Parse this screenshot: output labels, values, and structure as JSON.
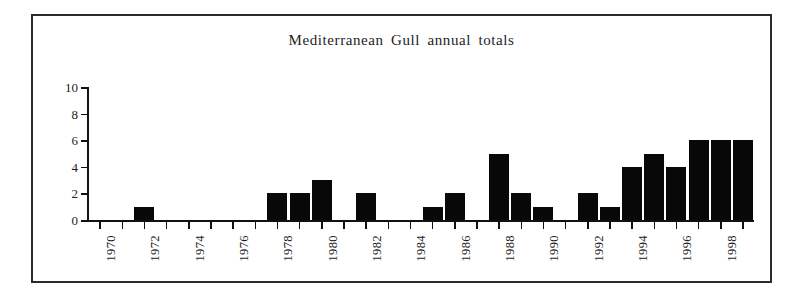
{
  "figure": {
    "title": "Mediterranean Gull annual totals",
    "frame_color": "#2b2b2b",
    "background": "#ffffff",
    "bar_color": "#080808"
  },
  "chart_data": {
    "type": "bar",
    "title": "Mediterranean Gull annual totals",
    "xlabel": "",
    "ylabel": "",
    "ylim": [
      0,
      10
    ],
    "ytick_labels": [
      "0",
      "2",
      "4",
      "6",
      "8",
      "10"
    ],
    "ytick_values": [
      0,
      2,
      4,
      6,
      8,
      10
    ],
    "grid": false,
    "legend": false,
    "xtick_labels": [
      "1970",
      "1972",
      "1974",
      "1976",
      "1978",
      "1980",
      "1982",
      "1984",
      "1986",
      "1988",
      "1990",
      "1992",
      "1994",
      "1996",
      "1998"
    ],
    "xtick_label_rotation": 90,
    "categories": [
      "1970",
      "1971",
      "1972",
      "1973",
      "1974",
      "1975",
      "1976",
      "1977",
      "1978",
      "1979",
      "1980",
      "1981",
      "1982",
      "1983",
      "1984",
      "1985",
      "1986",
      "1987",
      "1988",
      "1989",
      "1990",
      "1991",
      "1992",
      "1993",
      "1994",
      "1995",
      "1996",
      "1997",
      "1998",
      "1999"
    ],
    "values": [
      0,
      0,
      1,
      0,
      0,
      0,
      0,
      0,
      2,
      2,
      3,
      0,
      2,
      0,
      0,
      1,
      2,
      0,
      5,
      2,
      1,
      0,
      2,
      1,
      4,
      5,
      4,
      6,
      6,
      6
    ]
  }
}
